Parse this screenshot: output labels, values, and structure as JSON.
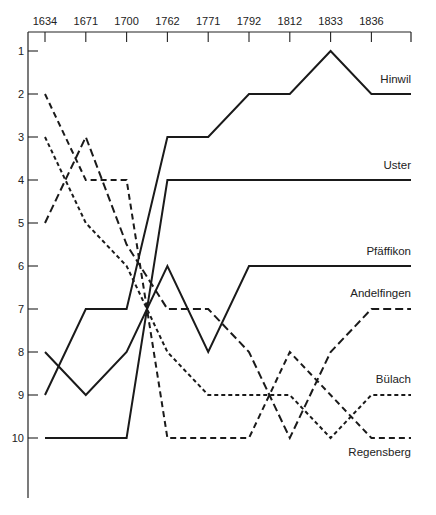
{
  "chart_data": {
    "type": "line",
    "title": "",
    "xlabel": "",
    "ylabel": "",
    "x": [
      "1634",
      "1671",
      "1700",
      "1762",
      "1771",
      "1792",
      "1812",
      "1833",
      "1836"
    ],
    "y_ticks": [
      1,
      2,
      3,
      4,
      5,
      6,
      7,
      8,
      9,
      10
    ],
    "ylim": [
      0.7,
      11.4
    ],
    "y_inverted": true,
    "x_axis_position": "top",
    "grid": false,
    "legend": "inline labels at right end of each line",
    "series": [
      {
        "name": "Hinwil",
        "style": "solid",
        "values": [
          9,
          7,
          7,
          3,
          3,
          2,
          2,
          1,
          2
        ]
      },
      {
        "name": "Uster",
        "style": "solid",
        "values": [
          10,
          10,
          10,
          4,
          4,
          4,
          4,
          4,
          4
        ]
      },
      {
        "name": "Pfäffikon",
        "style": "solid",
        "values": [
          8,
          9,
          8,
          6,
          8,
          6,
          6,
          6,
          6
        ]
      },
      {
        "name": "Andelfingen",
        "style": "long-dash",
        "values": [
          5,
          3,
          5.5,
          7,
          7,
          8,
          10,
          8,
          7
        ]
      },
      {
        "name": "Bülach",
        "style": "short-dash",
        "values": [
          3,
          5,
          6,
          8,
          9,
          9,
          9,
          10,
          9
        ]
      },
      {
        "name": "Regensberg",
        "style": "medium-dash",
        "values": [
          2,
          4,
          4,
          10,
          10,
          10,
          8,
          9,
          10
        ]
      }
    ]
  },
  "colors": {
    "line": "#1a1a1a",
    "axis": "#222222",
    "background": "#ffffff"
  }
}
